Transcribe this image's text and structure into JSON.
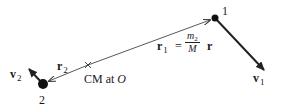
{
  "diagram": {
    "type": "two-body center-of-mass diagram",
    "colors": {
      "ink": "#1a1a1a",
      "line": "#333333",
      "background": "#ffffff"
    },
    "masses": [
      {
        "id": "1",
        "label": "1",
        "velocity_label": "v",
        "velocity_sub": "1"
      },
      {
        "id": "2",
        "label": "2",
        "velocity_label": "v",
        "velocity_sub": "2"
      }
    ],
    "center_of_mass": {
      "marker": "×",
      "label_prefix": "CM at ",
      "label_point": "O"
    },
    "vectors": {
      "r1": {
        "symbol": "r",
        "sub": "1",
        "equals": "=",
        "numerator_var": "m",
        "numerator_sub": "2",
        "denominator": "M",
        "times": "r"
      },
      "r2": {
        "symbol": "r",
        "sub": "2"
      }
    }
  }
}
